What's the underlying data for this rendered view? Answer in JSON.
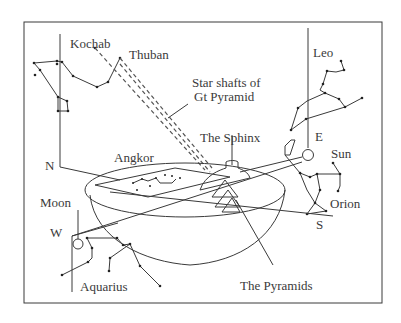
{
  "diagram": {
    "type": "sky-correlation illustration",
    "labels": {
      "kochab": "Kochab",
      "thuban": "Thuban",
      "star_shafts_line1": "Star shafts of",
      "star_shafts_line2": "Gt Pyramid",
      "leo": "Leo",
      "east": "E",
      "sun": "Sun",
      "north": "N",
      "angkor": "Angkor",
      "the_sphinx": "The Sphinx",
      "orion": "Orion",
      "moon": "Moon",
      "west": "W",
      "south": "S",
      "aquarius": "Aquarius",
      "the_pyramids": "The Pyramids"
    },
    "colors": {
      "ink": "#3a3a3a",
      "background": "#ffffff"
    }
  }
}
